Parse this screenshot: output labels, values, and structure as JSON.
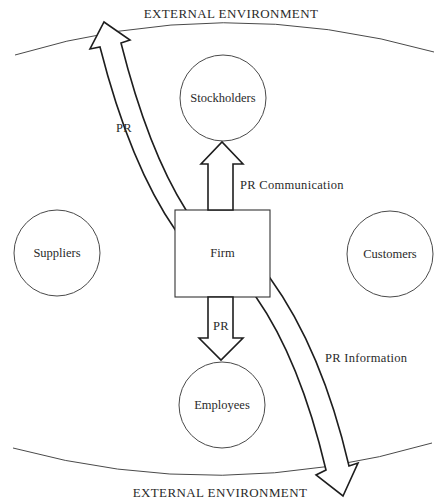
{
  "diagram": {
    "environment_top_label": "EXTERNAL ENVIRONMENT",
    "environment_bottom_label": "EXTERNAL ENVIRONMENT",
    "center_node": "Firm",
    "nodes": {
      "top": "Stockholders",
      "left": "Suppliers",
      "right": "Customers",
      "bottom": "Employees"
    },
    "edges": {
      "to_environment_top": "PR",
      "to_stockholders": "PR Communication",
      "to_employees": "PR",
      "to_environment_bottom": "PR Information"
    },
    "colors": {
      "background": "#ffffff",
      "line": "#1e1e1e",
      "text": "#2a2a2a"
    }
  }
}
